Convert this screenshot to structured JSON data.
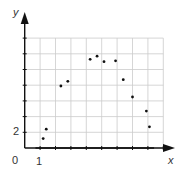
{
  "chart_data": {
    "type": "scatter",
    "title": "",
    "xlabel": "x",
    "ylabel": "y",
    "origin_label": "0",
    "x_tick_labels": [
      {
        "value": 1,
        "label": "1"
      }
    ],
    "y_tick_labels": [
      {
        "value": 2,
        "label": "2"
      }
    ],
    "xlim": [
      0,
      10
    ],
    "ylim": [
      0,
      15
    ],
    "grid": true,
    "x_grid_step": 1,
    "y_grid_step": 2,
    "series": [
      {
        "name": "data points",
        "type": "scatter",
        "points": [
          [
            1.2,
            1.2
          ],
          [
            1.4,
            2.4
          ],
          [
            2.35,
            7.9
          ],
          [
            2.8,
            8.5
          ],
          [
            4.25,
            11.3
          ],
          [
            4.7,
            11.7
          ],
          [
            5.15,
            11.0
          ],
          [
            5.9,
            11.1
          ],
          [
            6.4,
            8.7
          ],
          [
            7.0,
            6.5
          ],
          [
            7.9,
            4.7
          ],
          [
            8.1,
            2.7
          ]
        ]
      },
      {
        "name": "fitted curve",
        "type": "line",
        "model": "quadratic",
        "roots": [
          0.7,
          8.4
        ],
        "vertex": [
          4.55,
          11.5
        ]
      }
    ]
  },
  "colors": {
    "axis": "#111111",
    "grid": "#cccccc",
    "curve": "#111111",
    "points": "#111111",
    "text": "#333333"
  }
}
